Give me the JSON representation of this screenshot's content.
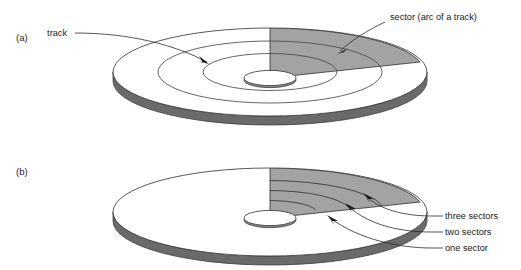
{
  "figure": {
    "background_color": "#ffffff"
  },
  "colors": {
    "sector_fill": "#a3a3a3",
    "platter_fill": "#ffffff",
    "platter_edge": "#3a3a3a",
    "rim_shadow": "#5a5a5a",
    "rim_shadow_dark": "#3d3d3d",
    "hub_fill": "#ffffff",
    "line": "#2b2b2b",
    "text": "#1a1a1a"
  },
  "panels": [
    {
      "id": "panel-a",
      "marker": "(a)",
      "labels": [
        {
          "name": "track-label",
          "text": "track"
        },
        {
          "name": "sector-label",
          "text": "sector (arc of a track)"
        }
      ],
      "track_ring_count": 2,
      "sector_count": 1
    },
    {
      "id": "panel-b",
      "marker": "(b)",
      "labels": [
        {
          "name": "three-sectors-label",
          "text": "three sectors"
        },
        {
          "name": "two-sectors-label",
          "text": "two sectors"
        },
        {
          "name": "one-sector-label",
          "text": "one sector"
        }
      ],
      "arc_band_count": 4,
      "arc_divider_count": 3
    }
  ]
}
